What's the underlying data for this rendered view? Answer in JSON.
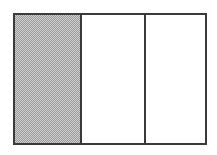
{
  "figure": {
    "canvas": {
      "width": 217,
      "height": 155,
      "background_color": "#ffffff"
    },
    "frame": {
      "x": 13,
      "y": 13,
      "width": 194,
      "height": 132,
      "border_color": "#3a3a3a",
      "border_width": 2,
      "fill_color": "#ffffff"
    },
    "divider": {
      "color": "#3a3a3a",
      "width": 2,
      "orientation": "vertical",
      "positions_x": [
        80,
        145
      ]
    },
    "cells": [
      {
        "index": 1,
        "label": "",
        "state": "shaded",
        "fill_color": "#b4b4b4",
        "fill_pattern": "checkerboard-dither",
        "width": 65,
        "has_left_divider": false
      },
      {
        "index": 2,
        "label": "",
        "state": "empty",
        "fill_color": "#ffffff",
        "fill_pattern": "none",
        "width": 64,
        "has_left_divider": true
      },
      {
        "index": 3,
        "label": "",
        "state": "empty",
        "fill_color": "#ffffff",
        "fill_pattern": "none",
        "width": 61,
        "has_left_divider": true
      }
    ]
  }
}
